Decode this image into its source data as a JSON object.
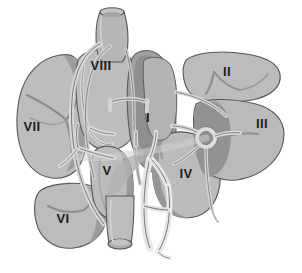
{
  "figure": {
    "view": "anterior schematic with segments separated",
    "background_color": "#ffffff"
  },
  "palette": {
    "parenchyma_light": "#bdbdbd",
    "parenchyma_mid": "#ababab",
    "parenchyma_dark": "#969696",
    "parenchyma_darker": "#8a8a8a",
    "vessel_light": "#dcdcdc",
    "vessel_pale": "#ebebeb",
    "vessel_white": "#f2f2f2",
    "outline": "#555555",
    "outline_soft": "#777777",
    "label_color": "#1e1e1e"
  },
  "labels": [
    {
      "id": "seg-1",
      "text": "I",
      "x": 148,
      "y": 122,
      "size": 12
    },
    {
      "id": "seg-2",
      "text": "II",
      "x": 227,
      "y": 76,
      "size": 12
    },
    {
      "id": "seg-3",
      "text": "III",
      "x": 262,
      "y": 128,
      "size": 12
    },
    {
      "id": "seg-4",
      "text": "IV",
      "x": 186,
      "y": 178,
      "size": 12
    },
    {
      "id": "seg-5",
      "text": "V",
      "x": 107,
      "y": 175,
      "size": 12
    },
    {
      "id": "seg-6",
      "text": "VI",
      "x": 63,
      "y": 223,
      "size": 12
    },
    {
      "id": "seg-7",
      "text": "VII",
      "x": 32,
      "y": 131,
      "size": 12
    },
    {
      "id": "seg-8",
      "text": "VIII",
      "x": 101,
      "y": 70,
      "size": 12
    }
  ],
  "structures": [
    {
      "id": "ivc-superior",
      "name": "inferior-vena-cava-superior",
      "kind": "vessel-tube"
    },
    {
      "id": "ivc-inferior",
      "name": "inferior-vena-cava-inferior",
      "kind": "vessel-tube"
    },
    {
      "id": "hepatic-veins",
      "name": "hepatic-vein-branches",
      "kind": "vessel-branch"
    },
    {
      "id": "portal-vein",
      "name": "portal-vein-trunk",
      "kind": "vessel-branch"
    },
    {
      "id": "biliary-tree",
      "name": "biliary-tree",
      "kind": "vessel-branch"
    },
    {
      "id": "hilum-hub",
      "name": "right-hilar-vascular-hub",
      "kind": "vessel-hub"
    }
  ]
}
